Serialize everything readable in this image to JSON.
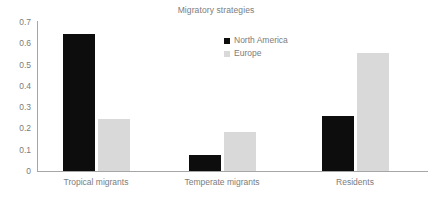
{
  "chart_data": {
    "type": "bar",
    "title": "Migratory strategies",
    "xlabel": "",
    "ylabel": "",
    "categories": [
      "Tropical migrants",
      "Temperate migrants",
      "Residents"
    ],
    "series": [
      {
        "name": "North America",
        "color": "#0D0D0D",
        "values": [
          0.645,
          0.075,
          0.26
        ]
      },
      {
        "name": "Europe",
        "color": "#D9D9D9",
        "values": [
          0.245,
          0.183,
          0.553
        ]
      }
    ],
    "ylim": [
      0,
      0.7
    ],
    "ytick_labels": [
      "0.7",
      "0.6",
      "0.5",
      "0.4",
      "0.3",
      "0.2",
      "0.1",
      "0"
    ],
    "ytick_values": [
      0.7,
      0.6,
      0.5,
      0.4,
      0.3,
      0.2,
      0.1,
      0
    ],
    "ytick_step": 0.1,
    "grid": false,
    "legend_position": "top-center-right",
    "legend_entries": [
      "North America",
      "Europe"
    ],
    "axis_color": "#A6A6A6",
    "text_color": "#7C7C7C",
    "background": "#FFFFFF"
  }
}
